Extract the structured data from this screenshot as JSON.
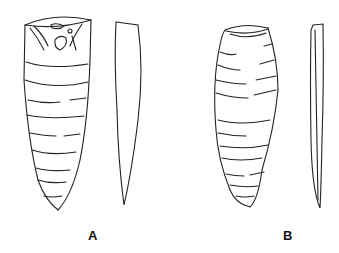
{
  "figure": {
    "panels": [
      {
        "label": "A",
        "views": [
          "front-view",
          "side-view"
        ]
      },
      {
        "label": "B",
        "views": [
          "front-view",
          "side-view"
        ]
      }
    ]
  }
}
